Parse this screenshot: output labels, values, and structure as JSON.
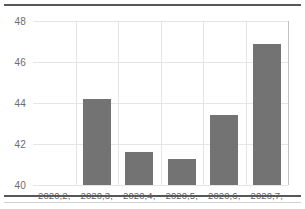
{
  "chart_data": {
    "type": "bar",
    "title": "",
    "xlabel": "",
    "ylabel": "",
    "categories": [
      "2020,2,",
      "2020,3,",
      "2020,4,",
      "2020,5,",
      "2020,6,",
      "2020,7,"
    ],
    "values": [
      null,
      44.2,
      41.6,
      41.25,
      43.4,
      46.9
    ],
    "ylim": [
      40,
      48
    ],
    "yticks": [
      "40",
      "42",
      "44",
      "46",
      "48"
    ],
    "ytick_values": [
      40,
      42,
      44,
      46,
      48
    ],
    "grid": true,
    "legend": "none",
    "bar_color": "#737373",
    "grid_color": "#e3e5e6",
    "axis_color": "#bfc2c4",
    "rule_color": "#555759",
    "background": "#ffffff"
  }
}
